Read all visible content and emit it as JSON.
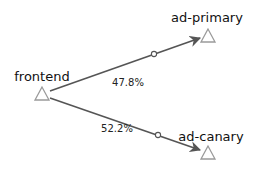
{
  "graph": {
    "type": "service-traffic-graph",
    "nodes": [
      {
        "id": "frontend",
        "label": "frontend",
        "shape": "triangle"
      },
      {
        "id": "ad-primary",
        "label": "ad-primary",
        "shape": "triangle"
      },
      {
        "id": "ad-canary",
        "label": "ad-canary",
        "shape": "triangle"
      }
    ],
    "edges": [
      {
        "from": "frontend",
        "to": "ad-primary",
        "label": "47.8%"
      },
      {
        "from": "frontend",
        "to": "ad-canary",
        "label": "52.2%"
      }
    ]
  },
  "colors": {
    "edge": "#555555",
    "node_stroke": "#9a9a9a",
    "text": "#111111",
    "background": "#ffffff"
  }
}
